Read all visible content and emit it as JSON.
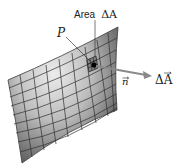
{
  "figure": {
    "area_label_word": "Area",
    "area_label_symbol": "ΔA",
    "point_label": "P",
    "normal_label": "n",
    "vector_label": "ΔA",
    "colors": {
      "surface_light": "#e6e6e6",
      "surface_dark": "#6a6a6a",
      "grid": "#2e2e2e",
      "arrow": "#8a8a8a",
      "patch": "#111111"
    }
  }
}
